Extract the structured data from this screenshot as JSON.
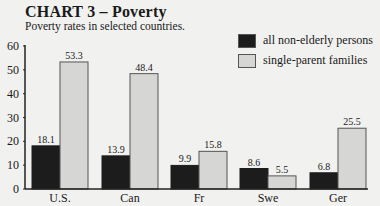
{
  "title": "CHART 3 – Poverty",
  "subtitle": "Poverty rates in selected countries.",
  "legend": [
    {
      "label": "all non-elderly persons",
      "color": "#1c1c1c"
    },
    {
      "label": "single-parent families",
      "color": "#d6d6d4"
    }
  ],
  "chart_data": {
    "type": "bar",
    "title": "CHART 3 – Poverty",
    "subtitle": "Poverty rates in selected countries.",
    "categories": [
      "U.S.",
      "Can",
      "Fr",
      "Swe",
      "Ger"
    ],
    "series": [
      {
        "name": "all non-elderly persons",
        "color": "#1c1c1c",
        "values": [
          18.1,
          13.9,
          9.9,
          8.6,
          6.8
        ]
      },
      {
        "name": "single-parent families",
        "color": "#d6d6d4",
        "values": [
          53.3,
          48.4,
          15.8,
          5.5,
          25.5
        ]
      }
    ],
    "xlabel": "",
    "ylabel": "",
    "ylim": [
      0,
      60
    ],
    "yticks": [
      0,
      10,
      20,
      30,
      40,
      50,
      60
    ],
    "grid": false,
    "legend_position": "top-right",
    "data_labels": true
  }
}
